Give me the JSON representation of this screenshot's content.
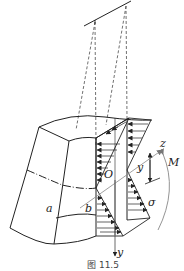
{
  "figure": {
    "caption": "图 11.5",
    "labels": {
      "z": "z",
      "y": "y",
      "O": "O",
      "M": "M",
      "sigma": "σ",
      "a": "a",
      "b": "b",
      "y_dist": "y"
    }
  },
  "colors": {
    "line": "#222222",
    "axis": "#888888",
    "background": "#ffffff"
  }
}
